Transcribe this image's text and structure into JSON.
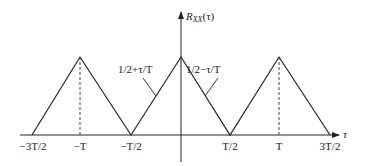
{
  "y_axis": {
    "label_main": "R",
    "label_sub": "XX",
    "label_arg": "(τ)"
  },
  "x_axis": {
    "label": "τ"
  },
  "tick_labels": {
    "neg_3T2": "−3T/2",
    "neg_T": "−T",
    "neg_T2": "−T/2",
    "pos_T2": "T/2",
    "pos_T": "T",
    "pos_3T2": "3T/2"
  },
  "annotations": {
    "rising": "1/2+τ/T",
    "falling": "1/2−τ/T"
  },
  "colors": {
    "line": "#222222",
    "background": "#ffffff"
  }
}
